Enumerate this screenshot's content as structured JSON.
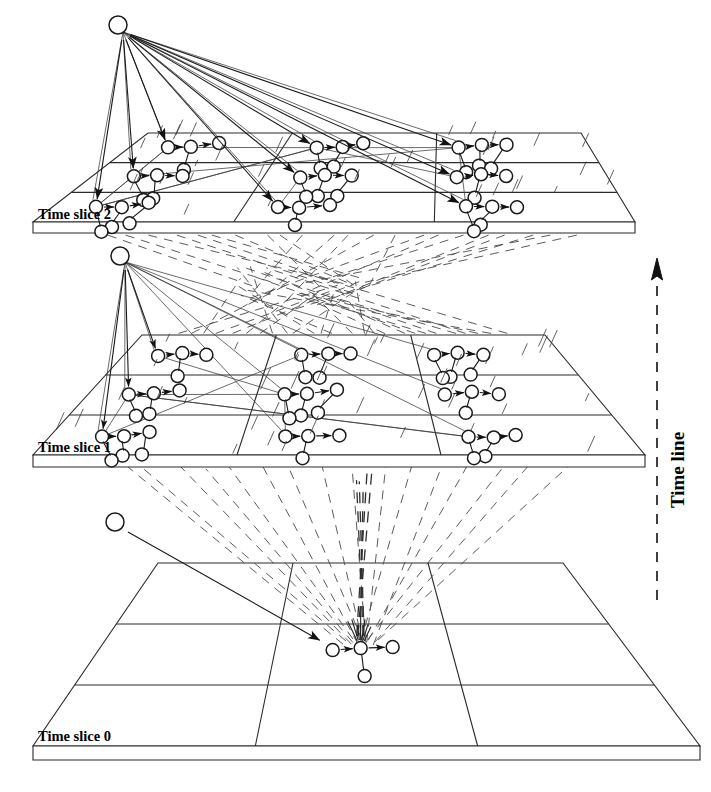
{
  "figure": {
    "background": "#ffffff",
    "ink_color": "#1a1a1a",
    "width": 711,
    "height": 792
  },
  "axis": {
    "label": "Time line",
    "direction": "upward",
    "style": "dashed-arrow",
    "color": "#111111"
  },
  "slices": [
    {
      "id": "slice2",
      "label": "Time slice 2",
      "order": 2,
      "label_x": 38,
      "label_y": 219,
      "plane": {
        "tl": [
          148,
          133
        ],
        "tr": [
          581,
          133
        ],
        "br": [
          635,
          222
        ],
        "bl": [
          33,
          222
        ],
        "depth": 11
      },
      "rows": 3,
      "cols": 3,
      "apex": {
        "x": 118,
        "y": 25,
        "r": 9
      },
      "cluster_count": 9
    },
    {
      "id": "slice1",
      "label": "Time slice 1",
      "order": 1,
      "label_x": 38,
      "label_y": 452,
      "plane": {
        "tl": [
          142,
          335
        ],
        "tr": [
          545,
          335
        ],
        "br": [
          645,
          455
        ],
        "bl": [
          33,
          455
        ],
        "depth": 12
      },
      "rows": 3,
      "cols": 3,
      "apex": {
        "x": 120,
        "y": 256,
        "r": 9
      },
      "cluster_count": 9
    },
    {
      "id": "slice0",
      "label": "Time slice 0",
      "order": 0,
      "label_x": 38,
      "label_y": 741,
      "plane": {
        "tl": [
          158,
          563
        ],
        "tr": [
          563,
          563
        ],
        "br": [
          700,
          746
        ],
        "bl": [
          33,
          746
        ],
        "depth": 14
      },
      "rows": 3,
      "cols": 3,
      "apex": {
        "x": 115,
        "y": 522,
        "r": 9
      },
      "cluster_count": 1
    }
  ],
  "node": {
    "radius": 6.5,
    "fill": "#ffffff",
    "stroke": "#1a1a1a"
  },
  "cluster_template": {
    "description": "root node with chain of two nodes to the right and one branch node below-right",
    "chain_dx": 28,
    "branch_dx": 16,
    "branch_dy": 20
  },
  "legend_text": {
    "slice_labels": [
      "Time slice 0",
      "Time slice 1",
      "Time slice 2"
    ],
    "axis_label": "Time line"
  }
}
